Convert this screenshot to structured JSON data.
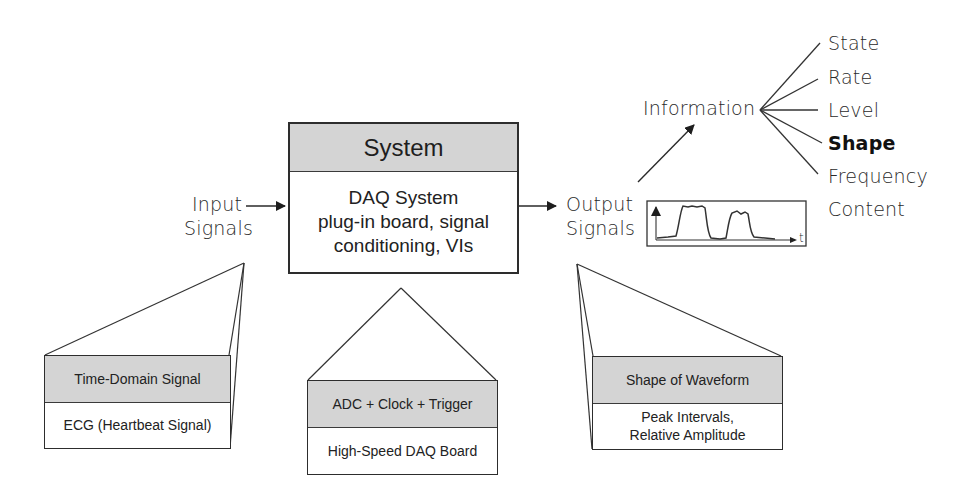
{
  "system_box": {
    "title": "System",
    "line1": "DAQ System",
    "line2": "plug-in board, signal",
    "line3": "conditioning, VIs"
  },
  "input": {
    "line1": "Input",
    "line2": "Signals"
  },
  "output": {
    "line1": "Output",
    "line2": "Signals"
  },
  "waveform_axis_label": "t",
  "information": {
    "label": "Information",
    "items": [
      "State",
      "Rate",
      "Level",
      "Shape",
      "Frequency",
      "Content"
    ],
    "highlighted": "Shape"
  },
  "detail_boxes": {
    "input": {
      "header": "Time-Domain Signal",
      "body": "ECG (Heartbeat Signal)"
    },
    "system": {
      "header": "ADC + Clock + Trigger",
      "body": "High-Speed DAQ Board"
    },
    "output": {
      "header": "Shape of Waveform",
      "body_line1": "Peak Intervals,",
      "body_line2": "Relative Amplitude"
    }
  },
  "colors": {
    "header_fill": "#d4d4d4",
    "line": "#2d2d2d"
  }
}
